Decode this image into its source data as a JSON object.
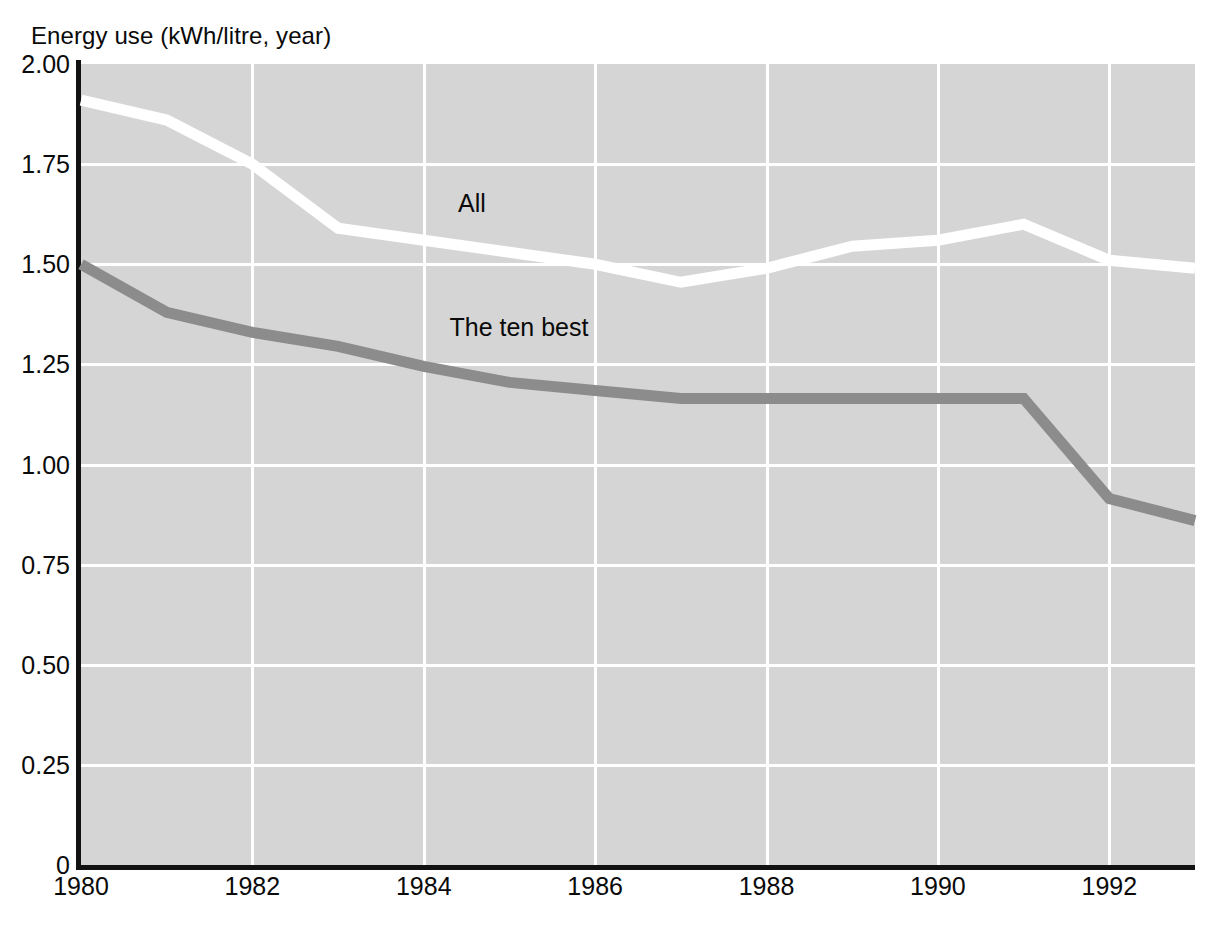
{
  "chart_data": {
    "type": "line",
    "title": "Energy use (kWh/litre, year)",
    "ylabel": "Energy use (kWh/litre, year)",
    "xlabel": "",
    "xlim": [
      1980,
      1993
    ],
    "ylim": [
      0,
      2.0
    ],
    "grid": true,
    "legend_position": "inline-annotations",
    "plot_background": "#d5d5d5",
    "x": [
      1980,
      1981,
      1982,
      1983,
      1984,
      1985,
      1986,
      1987,
      1988,
      1989,
      1990,
      1991,
      1992,
      1993
    ],
    "ytick_labels": [
      "0",
      "0.25",
      "0.50",
      "0.75",
      "1.00",
      "1.25",
      "1.50",
      "1.75",
      "2.00"
    ],
    "ytick_values": [
      0,
      0.25,
      0.5,
      0.75,
      1.0,
      1.25,
      1.5,
      1.75,
      2.0
    ],
    "xtick_labels": [
      "1980",
      "1982",
      "1984",
      "1986",
      "1988",
      "1990",
      "1992"
    ],
    "xtick_values": [
      1980,
      1982,
      1984,
      1986,
      1988,
      1990,
      1992
    ],
    "series": [
      {
        "name": "All",
        "label": "All",
        "color": "#ffffff",
        "label_x": 1984.4,
        "label_y": 1.645,
        "values": [
          1.91,
          1.86,
          1.75,
          1.59,
          1.56,
          1.53,
          1.5,
          1.455,
          1.49,
          1.545,
          1.56,
          1.6,
          1.51,
          1.49
        ]
      },
      {
        "name": "The ten best",
        "label": "The ten best",
        "color": "#8c8c8c",
        "label_x": 1984.3,
        "label_y": 1.335,
        "values": [
          1.5,
          1.38,
          1.33,
          1.295,
          1.245,
          1.205,
          1.185,
          1.165,
          1.165,
          1.165,
          1.165,
          1.165,
          0.915,
          0.86
        ]
      }
    ]
  }
}
